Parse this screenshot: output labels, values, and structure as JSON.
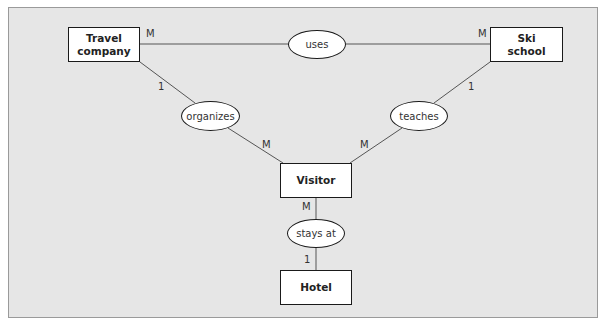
{
  "diagram": {
    "type": "entity-relationship",
    "colors": {
      "background": "#e6e6e6",
      "border": "#9a9a9a",
      "line": "#555555",
      "node_fill": "#ffffff",
      "node_stroke": "#1a1a1a"
    },
    "entities": [
      {
        "id": "travel_company",
        "line1": "Travel",
        "line2": "company"
      },
      {
        "id": "ski_school",
        "line1": "Ski",
        "line2": "school"
      },
      {
        "id": "visitor",
        "label": "Visitor"
      },
      {
        "id": "hotel",
        "label": "Hotel"
      }
    ],
    "relationships": [
      {
        "id": "uses",
        "label": "uses",
        "from": "travel_company",
        "to": "ski_school",
        "from_card": "M",
        "to_card": "M"
      },
      {
        "id": "organizes",
        "label": "organizes",
        "from": "travel_company",
        "to": "visitor",
        "from_card": "1",
        "to_card": "M"
      },
      {
        "id": "teaches",
        "label": "teaches",
        "from": "ski_school",
        "to": "visitor",
        "from_card": "1",
        "to_card": "M"
      },
      {
        "id": "stays_at",
        "label": "stays at",
        "from": "visitor",
        "to": "hotel",
        "from_card": "M",
        "to_card": "1"
      }
    ]
  }
}
